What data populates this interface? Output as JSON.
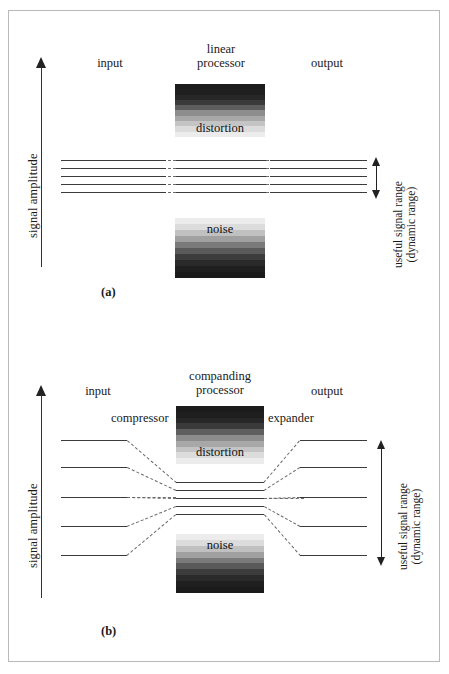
{
  "figure": {
    "axis_label": "signal amplitude",
    "range_label_line1": "useful signal range",
    "range_label_line2": "(dynamic range)",
    "distortion_label": "distortion",
    "noise_label": "noise",
    "input_label": "input",
    "output_label": "output"
  },
  "panel_a": {
    "caption": "(a)",
    "processor_line1": "linear",
    "processor_line2": "processor",
    "input_label": "input",
    "output_label": "output",
    "distortion_label": "distortion",
    "noise_label": "noise"
  },
  "panel_b": {
    "caption": "(b)",
    "processor_line1": "companding",
    "processor_line2": "processor",
    "input_label": "input",
    "output_label": "output",
    "compressor_label": "compressor",
    "expander_label": "expander",
    "distortion_label": "distortion",
    "noise_label": "noise"
  },
  "colors": {
    "line": "#3a3a3a",
    "dashed_line": "#6a6a6a",
    "arrow": "#222222",
    "frame": "#b9b9b9",
    "background": "#ffffff"
  },
  "chart_data": {
    "type": "diagram",
    "panels": [
      {
        "id": "a",
        "caption": "(a)",
        "processor": "linear processor",
        "description": "Five equally spaced signal levels pass unchanged through a linear processor; distortion region sits above and noise region below the useful signal range.",
        "input_levels": [
          1,
          2,
          3,
          4,
          5
        ],
        "processor_levels": [
          1,
          2,
          3,
          4,
          5
        ],
        "output_levels": [
          1,
          2,
          3,
          4,
          5
        ],
        "distortion_gradient": "dark-to-light downward",
        "noise_gradient": "light-to-dark downward"
      },
      {
        "id": "b",
        "caption": "(b)",
        "processor": "companding processor",
        "description": "Five widely spaced input levels are compressed into a narrow band inside the processor, then expanded back to the original spacing at the output.",
        "input_levels": [
          1,
          2,
          3,
          4,
          5
        ],
        "processor_levels": [
          2.6,
          2.8,
          3.0,
          3.2,
          3.4
        ],
        "output_levels": [
          1,
          2,
          3,
          4,
          5
        ],
        "stages": [
          "compressor",
          "companding processor",
          "expander"
        ],
        "distortion_gradient": "dark-to-light downward",
        "noise_gradient": "light-to-dark downward"
      }
    ],
    "axes": {
      "y_label": "signal amplitude",
      "y_direction": "increasing upward"
    },
    "annotations": [
      "useful signal range",
      "(dynamic range)"
    ]
  },
  "gradients": {
    "distortion_bands": [
      "#1c1c1c",
      "#1f1f1f",
      "#272727",
      "#3a3a3a",
      "#5e5e5e",
      "#8c8c8c",
      "#a8a8a8",
      "#c4c4c4",
      "#dcdcdc",
      "#ececec"
    ],
    "noise_bands": [
      "#ececec",
      "#dcdcdc",
      "#c0c0c0",
      "#a0a0a0",
      "#7a7a7a",
      "#5a5a5a",
      "#3c3c3c",
      "#2a2a2a",
      "#1f1f1f",
      "#1a1a1a"
    ]
  }
}
